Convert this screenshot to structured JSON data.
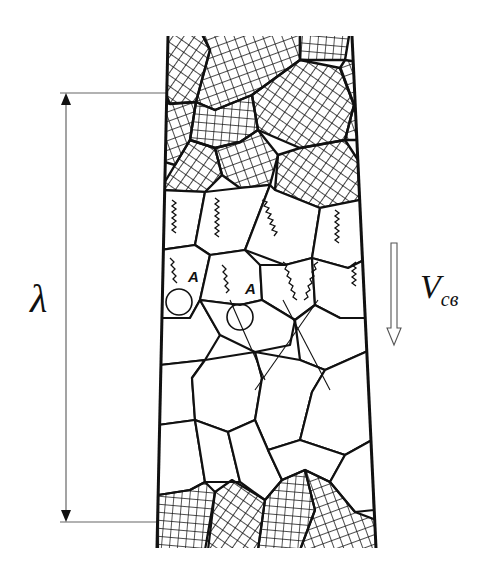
{
  "diagram": {
    "type": "grain-structure-schematic",
    "labels": {
      "dimension_symbol": "λ",
      "velocity_symbol": "V",
      "velocity_subscript": "св",
      "point_a_1": "A",
      "point_a_2": "A"
    },
    "regions": [
      {
        "name": "top-hatched-grains",
        "fill": "cross-hatch"
      },
      {
        "name": "middle-grains-with-zigzag-marks",
        "fill": "none"
      },
      {
        "name": "lower-polygonal-grains",
        "fill": "none"
      },
      {
        "name": "bottom-hatched-grains",
        "fill": "cross-hatch"
      }
    ],
    "arrows": [
      {
        "name": "dimension-arrow",
        "direction": "vertical-double",
        "label": "λ"
      },
      {
        "name": "velocity-arrow",
        "direction": "down",
        "label": "Vсв"
      }
    ],
    "colors": {
      "line": "#111111",
      "background": "#ffffff",
      "guide": "#666666"
    }
  }
}
